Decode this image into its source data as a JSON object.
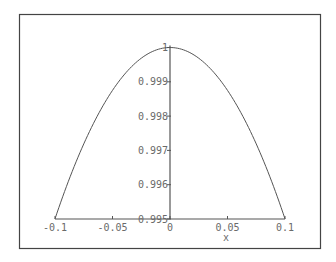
{
  "chart_data": {
    "type": "line",
    "title": "",
    "xlabel": "x",
    "ylabel": "",
    "xlim": [
      -0.1,
      0.1
    ],
    "ylim": [
      0.995,
      1.0
    ],
    "grid": false,
    "legend": null,
    "x_ticks": [
      {
        "value": -0.1,
        "label": "-0.1"
      },
      {
        "value": -0.05,
        "label": "-0.05"
      },
      {
        "value": 0,
        "label": "0"
      },
      {
        "value": 0.05,
        "label": "0.05"
      },
      {
        "value": 0.1,
        "label": "0.1"
      }
    ],
    "y_ticks": [
      {
        "value": 0.995,
        "label": "0.995"
      },
      {
        "value": 0.996,
        "label": "0.996"
      },
      {
        "value": 0.997,
        "label": "0.997"
      },
      {
        "value": 0.998,
        "label": "0.998"
      },
      {
        "value": 0.999,
        "label": "0.999"
      },
      {
        "value": 1.0,
        "label": "1"
      }
    ],
    "series": [
      {
        "name": "cos(x)",
        "x": [
          -0.1,
          -0.09,
          -0.08,
          -0.07,
          -0.06,
          -0.05,
          -0.04,
          -0.03,
          -0.02,
          -0.01,
          0,
          0.01,
          0.02,
          0.03,
          0.04,
          0.05,
          0.06,
          0.07,
          0.08,
          0.09,
          0.1
        ],
        "y": [
          0.995004,
          0.995953,
          0.996802,
          0.997551,
          0.998201,
          0.99875,
          0.9992,
          0.99955,
          0.9998,
          0.99995,
          1.0,
          0.99995,
          0.9998,
          0.99955,
          0.9992,
          0.99875,
          0.998201,
          0.997551,
          0.996802,
          0.995953,
          0.995004
        ]
      }
    ]
  },
  "style": {
    "frame_color": "#444444",
    "axis_color": "#555555",
    "curve_color": "#555555",
    "text_color": "#6a6a6a"
  }
}
